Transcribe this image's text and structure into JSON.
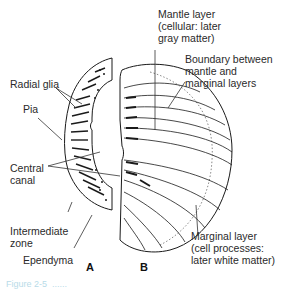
{
  "figure": {
    "panels": [
      {
        "id": "A",
        "label": "A"
      },
      {
        "id": "B",
        "label": "B"
      }
    ],
    "labels": {
      "mantle_layer": "Mantle layer\n(cellular: later\ngray matter)",
      "boundary": "Boundary between\nmantle and\nmarginal layers",
      "radial_glia": "Radial glia",
      "pia": "Pia",
      "central_canal": "Central\ncanal",
      "intermediate_zone": "Intermediate\nzone",
      "ependyma": "Ependyma",
      "marginal_layer": "Marginal layer\n(cell processes:\nlater white matter)"
    },
    "caption": "Figure 2-5  ......"
  }
}
